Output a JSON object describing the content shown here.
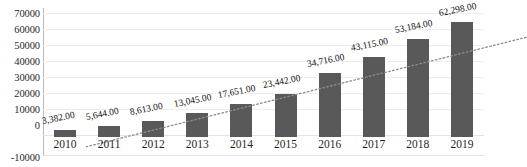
{
  "chart_data": {
    "type": "bar",
    "title": "",
    "xlabel": "",
    "ylabel": "",
    "grid": true,
    "legend": "none",
    "ylim": [
      -10000,
      70000
    ],
    "ytick_values": [
      70000,
      60000,
      50000,
      40000,
      30000,
      20000,
      10000,
      0,
      -10000
    ],
    "ytick_labels": [
      "70000",
      "60000",
      "50000",
      "40000",
      "30000",
      "20000",
      "10000",
      "0",
      "-10000"
    ],
    "categories": [
      "2010",
      "2011",
      "2012",
      "2013",
      "2014",
      "2015",
      "2016",
      "2017",
      "2018",
      "2019"
    ],
    "values": [
      3382,
      5644,
      8613,
      13045,
      17651,
      23442,
      34716,
      43115,
      53184,
      62298
    ],
    "data_labels": [
      "3,382.00",
      "5,644.00",
      "8,613.00",
      "13,045.00",
      "17,651.00",
      "23,442.00",
      "34,716.00",
      "43,115.00",
      "53,184.00",
      "62,298.00"
    ],
    "series": [
      {
        "name": "values",
        "type": "bar",
        "color": "#595959",
        "values": [
          3382,
          5644,
          8613,
          13045,
          17651,
          23442,
          34716,
          43115,
          53184,
          62298
        ]
      },
      {
        "name": "trendline",
        "type": "line",
        "style": "dotted",
        "color": "#8c8c8c",
        "start_value": -1200,
        "end_value": 58500
      }
    ],
    "colors": {
      "bar": "#595959",
      "trendline": "#8c8c8c",
      "gridline": "#eeeeee",
      "axis": "#b9b9b9",
      "text": "#1f1f1f",
      "background": "#ffffff"
    }
  },
  "title_remnant": ""
}
